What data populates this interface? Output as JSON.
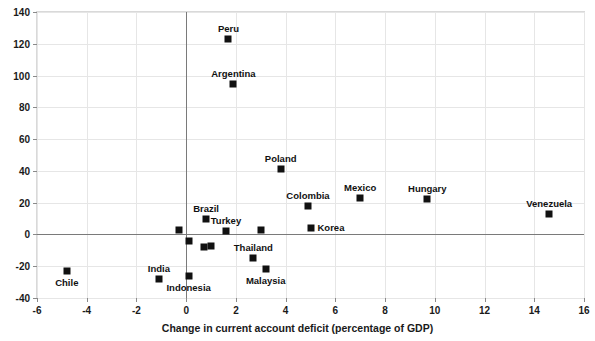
{
  "chart_data": {
    "type": "scatter",
    "title": "",
    "xlabel": "Change in current account deficit (percentage of GDP)",
    "ylabel": "",
    "xlim": [
      -6,
      16
    ],
    "ylim": [
      -40,
      140
    ],
    "xticks": [
      -6,
      -4,
      -2,
      0,
      2,
      4,
      6,
      8,
      10,
      12,
      14,
      16
    ],
    "yticks": [
      -40,
      -20,
      0,
      20,
      40,
      60,
      80,
      100,
      120,
      140
    ],
    "grid": true,
    "legend": "none",
    "marker": "filled-square",
    "marker_color": "#111111",
    "points": [
      {
        "label": "Peru",
        "x": 1.7,
        "y": 123,
        "label_pos": "above"
      },
      {
        "label": "Argentina",
        "x": 1.9,
        "y": 95,
        "label_pos": "above"
      },
      {
        "label": "Poland",
        "x": 3.8,
        "y": 41,
        "label_pos": "above"
      },
      {
        "label": "Colombia",
        "x": 4.9,
        "y": 18,
        "label_pos": "above"
      },
      {
        "label": "Mexico",
        "x": 7.0,
        "y": 23,
        "label_pos": "above"
      },
      {
        "label": "Hungary",
        "x": 9.7,
        "y": 22,
        "label_pos": "above"
      },
      {
        "label": "Venezuela",
        "x": 14.6,
        "y": 13,
        "label_pos": "above"
      },
      {
        "label": "Korea",
        "x": 5.0,
        "y": 4,
        "label_pos": "right"
      },
      {
        "label": "Brazil",
        "x": 0.8,
        "y": 10,
        "label_pos": "above"
      },
      {
        "label": "Turkey",
        "x": 1.6,
        "y": 2,
        "label_pos": "above"
      },
      {
        "label": "Thailand",
        "x": 2.7,
        "y": -15,
        "label_pos": "above"
      },
      {
        "label": "Malaysia",
        "x": 3.2,
        "y": -22,
        "label_pos": "below"
      },
      {
        "label": "India",
        "x": -1.1,
        "y": -28,
        "label_pos": "above"
      },
      {
        "label": "Indonesia",
        "x": 0.1,
        "y": -26,
        "label_pos": "below"
      },
      {
        "label": "Chile",
        "x": -4.8,
        "y": -23,
        "label_pos": "below"
      },
      {
        "label": "",
        "x": -0.3,
        "y": 3,
        "label_pos": "none"
      },
      {
        "label": "",
        "x": 0.1,
        "y": -4,
        "label_pos": "none"
      },
      {
        "label": "",
        "x": 0.7,
        "y": -8,
        "label_pos": "none"
      },
      {
        "label": "",
        "x": 1.0,
        "y": -7,
        "label_pos": "none"
      },
      {
        "label": "",
        "x": 3.0,
        "y": 3,
        "label_pos": "none"
      }
    ]
  }
}
